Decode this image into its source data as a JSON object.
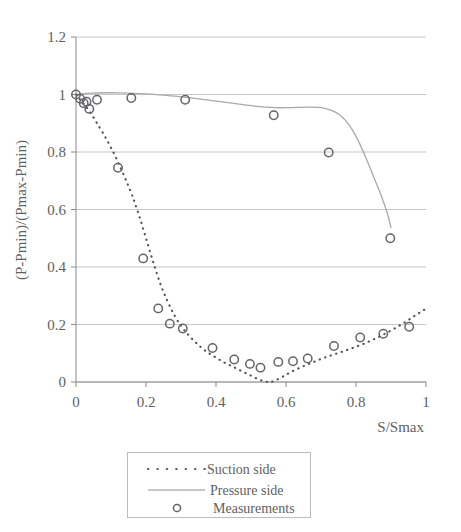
{
  "chart_data": {
    "type": "line",
    "title": "",
    "xlabel": "S/Smax",
    "ylabel": "(P-Pmin)/(Pmax-Pmin)",
    "xlim": [
      0,
      1
    ],
    "ylim": [
      0,
      1.2
    ],
    "xticks": [
      "0",
      "0.2",
      "0.4",
      "0.6",
      "0.8",
      "1"
    ],
    "xtick_values": [
      0,
      0.2,
      0.4,
      0.6,
      0.8,
      1
    ],
    "yticks": [
      "0",
      "0.2",
      "0.4",
      "0.6",
      "0.8",
      "1",
      "1.2"
    ],
    "ytick_values": [
      0,
      0.2,
      0.4,
      0.6,
      0.8,
      1,
      1.2
    ],
    "grid": true,
    "legend_position": "below-center",
    "legend": [
      {
        "label": "Suction side",
        "style": "dotted-line",
        "color": "#55555a"
      },
      {
        "label": "Pressure side",
        "style": "solid-line",
        "color": "#a9a9ad"
      },
      {
        "label": "Measurements",
        "style": "open-circle-marker",
        "color": "#63636a"
      }
    ],
    "series": [
      {
        "name": "Suction side",
        "style": "dotted-line",
        "color": "#55555a",
        "x": [
          0.0,
          0.01,
          0.02,
          0.03,
          0.045,
          0.06,
          0.08,
          0.1,
          0.12,
          0.14,
          0.16,
          0.18,
          0.2,
          0.22,
          0.24,
          0.26,
          0.28,
          0.3,
          0.32,
          0.34,
          0.36,
          0.38,
          0.4,
          0.42,
          0.44,
          0.46,
          0.48,
          0.5,
          0.52,
          0.54,
          0.555,
          0.57,
          0.59,
          0.61,
          0.64,
          0.67,
          0.7,
          0.73,
          0.76,
          0.79,
          0.82,
          0.85,
          0.88,
          0.91,
          0.94,
          0.97,
          1.0
        ],
        "y": [
          1.0,
          0.985,
          0.97,
          0.955,
          0.93,
          0.9,
          0.86,
          0.815,
          0.765,
          0.71,
          0.65,
          0.58,
          0.5,
          0.42,
          0.345,
          0.285,
          0.235,
          0.195,
          0.165,
          0.14,
          0.118,
          0.1,
          0.085,
          0.07,
          0.058,
          0.046,
          0.034,
          0.022,
          0.01,
          0.002,
          0.0,
          0.006,
          0.018,
          0.032,
          0.05,
          0.065,
          0.08,
          0.093,
          0.105,
          0.118,
          0.132,
          0.148,
          0.166,
          0.186,
          0.208,
          0.232,
          0.255
        ]
      },
      {
        "name": "Pressure side",
        "style": "solid-line",
        "color": "#a9a9ad",
        "x": [
          0.0,
          0.015,
          0.03,
          0.05,
          0.08,
          0.11,
          0.15,
          0.2,
          0.25,
          0.3,
          0.35,
          0.4,
          0.45,
          0.5,
          0.54,
          0.57,
          0.6,
          0.63,
          0.66,
          0.69,
          0.71,
          0.73,
          0.75,
          0.77,
          0.79,
          0.81,
          0.83,
          0.85,
          0.87,
          0.89,
          0.9
        ],
        "y": [
          1.0,
          1.002,
          1.004,
          1.005,
          1.006,
          1.006,
          1.005,
          1.002,
          0.998,
          0.992,
          0.985,
          0.977,
          0.969,
          0.961,
          0.956,
          0.954,
          0.954,
          0.955,
          0.956,
          0.955,
          0.952,
          0.945,
          0.932,
          0.91,
          0.876,
          0.83,
          0.775,
          0.715,
          0.655,
          0.585,
          0.535
        ]
      }
    ],
    "measurements": {
      "name": "Measurements",
      "marker": "open-circle",
      "color": "#63636a",
      "points": [
        {
          "x": 0.0,
          "y": 1.0
        },
        {
          "x": 0.012,
          "y": 0.985
        },
        {
          "x": 0.022,
          "y": 0.97
        },
        {
          "x": 0.03,
          "y": 0.975
        },
        {
          "x": 0.038,
          "y": 0.95
        },
        {
          "x": 0.06,
          "y": 0.982
        },
        {
          "x": 0.12,
          "y": 0.745
        },
        {
          "x": 0.158,
          "y": 0.988
        },
        {
          "x": 0.192,
          "y": 0.43
        },
        {
          "x": 0.235,
          "y": 0.256
        },
        {
          "x": 0.268,
          "y": 0.203
        },
        {
          "x": 0.305,
          "y": 0.186
        },
        {
          "x": 0.312,
          "y": 0.982
        },
        {
          "x": 0.39,
          "y": 0.118
        },
        {
          "x": 0.452,
          "y": 0.078
        },
        {
          "x": 0.497,
          "y": 0.063
        },
        {
          "x": 0.527,
          "y": 0.05
        },
        {
          "x": 0.578,
          "y": 0.07
        },
        {
          "x": 0.62,
          "y": 0.072
        },
        {
          "x": 0.662,
          "y": 0.082
        },
        {
          "x": 0.565,
          "y": 0.928
        },
        {
          "x": 0.737,
          "y": 0.125
        },
        {
          "x": 0.722,
          "y": 0.798
        },
        {
          "x": 0.812,
          "y": 0.155
        },
        {
          "x": 0.878,
          "y": 0.168
        },
        {
          "x": 0.898,
          "y": 0.5
        },
        {
          "x": 0.952,
          "y": 0.192
        }
      ]
    }
  }
}
